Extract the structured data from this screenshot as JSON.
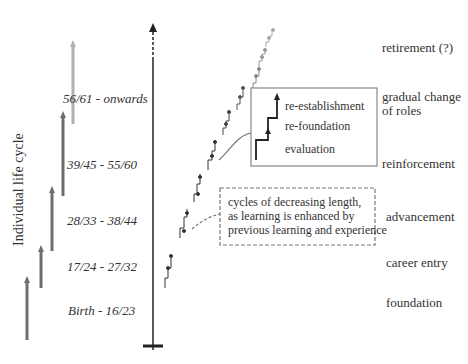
{
  "diagram": {
    "axis_label": "Individual life cycle",
    "age_ranges": [
      {
        "label": "56/61 - onwards",
        "arrow_color": "#b0b0b0"
      },
      {
        "label": "39/45 - 55/60",
        "arrow_color": "#6e6e6e"
      },
      {
        "label": "28/33 - 38/44",
        "arrow_color": "#6e6e6e"
      },
      {
        "label": "17/24 - 27/32",
        "arrow_color": "#6e6e6e"
      },
      {
        "label": "Birth - 16/23",
        "arrow_color": "#6e6e6e"
      }
    ],
    "phases": [
      {
        "label": "retirement (?)"
      },
      {
        "label": "gradual change of roles"
      },
      {
        "label": "reinforcement"
      },
      {
        "label": "advancement"
      },
      {
        "label": "career entry"
      },
      {
        "label": "foundation"
      }
    ],
    "inset": {
      "items": [
        "re-establishment",
        "re-foundation",
        "evaluation"
      ]
    },
    "note": {
      "lines": [
        "cycles of decreasing length,",
        "as learning is enhanced by",
        "previous learning and experience"
      ]
    },
    "colors": {
      "dark_line": "#222222",
      "grey_arrow": "#6e6e6e",
      "light_arrow": "#b0b0b0",
      "box_border": "#888888"
    }
  }
}
